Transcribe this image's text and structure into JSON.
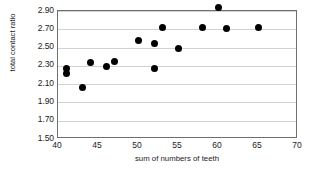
{
  "chart_data": {
    "type": "scatter",
    "title": "",
    "xlabel": "sum of numbers of teeth",
    "ylabel": "total contact ratio",
    "xlim": [
      40,
      70
    ],
    "ylim": [
      1.5,
      2.9
    ],
    "xticks": [
      "40",
      "45",
      "50",
      "55",
      "60",
      "65",
      "70"
    ],
    "xtick_values": [
      40,
      45,
      50,
      55,
      60,
      65,
      70
    ],
    "yticks": [
      "1.50",
      "1.70",
      "1.90",
      "2.10",
      "2.30",
      "2.50",
      "2.70",
      "2.90"
    ],
    "ytick_values": [
      1.5,
      1.7,
      1.9,
      2.1,
      2.3,
      2.5,
      2.7,
      2.9
    ],
    "grid": "horizontal",
    "legend": "none",
    "marker": "filled-circle",
    "marker_color": "#000000",
    "points": [
      {
        "x": 41,
        "y": 2.27
      },
      {
        "x": 41,
        "y": 2.22
      },
      {
        "x": 43,
        "y": 2.06
      },
      {
        "x": 44,
        "y": 2.34
      },
      {
        "x": 46,
        "y": 2.29
      },
      {
        "x": 47,
        "y": 2.35
      },
      {
        "x": 50,
        "y": 2.58
      },
      {
        "x": 52,
        "y": 2.54
      },
      {
        "x": 52,
        "y": 2.27
      },
      {
        "x": 53,
        "y": 2.72
      },
      {
        "x": 55,
        "y": 2.49
      },
      {
        "x": 58,
        "y": 2.72
      },
      {
        "x": 60,
        "y": 2.94
      },
      {
        "x": 61,
        "y": 2.71
      },
      {
        "x": 65,
        "y": 2.72
      }
    ]
  },
  "colors": {
    "axis": "#6f6f6f",
    "gridline": "#d2d2d2",
    "marker": "#000000",
    "text": "#222222",
    "background": "#ffffff"
  }
}
